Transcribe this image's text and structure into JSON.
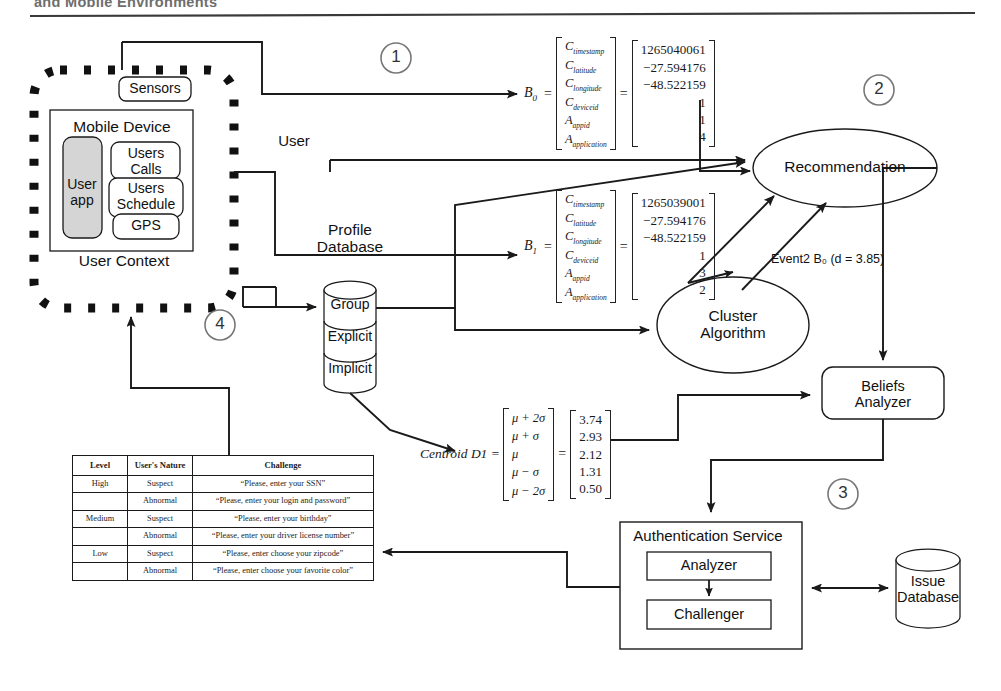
{
  "header": {
    "running_title": "and Mobile Environments"
  },
  "steps": [
    {
      "id": "step-1",
      "label": "1"
    },
    {
      "id": "step-2",
      "label": "2"
    },
    {
      "id": "step-3",
      "label": "3"
    },
    {
      "id": "step-4",
      "label": "4"
    }
  ],
  "user_context": {
    "boundary_label": "User Context",
    "sensors_label": "Sensors",
    "mobile_device": {
      "title": "Mobile Device",
      "user_app": "User\napp",
      "modules": [
        {
          "label": "Users\nCalls"
        },
        {
          "label": "Users\nSchedule"
        },
        {
          "label": "GPS"
        }
      ]
    }
  },
  "labels": {
    "user": "User",
    "event2": "Event2 B₀ (d = 3.85)"
  },
  "profile_database": {
    "title": "Profile\nDatabase",
    "segments": [
      "Group",
      "Explicit",
      "Implicit"
    ]
  },
  "nodes": {
    "recommendation": "Recommendation",
    "cluster_algorithm": "Cluster\nAlgorithm",
    "beliefs_analyzer": "Beliefs\nAnalyzer",
    "authentication_service": {
      "title": "Authentication Service",
      "analyzer": "Analyzer",
      "challenger": "Challenger"
    },
    "issue_database": "Issue\nDatabase"
  },
  "equations": {
    "b0": {
      "name": "B",
      "subscript": "0",
      "symbols": [
        "C_timestamp",
        "C_latitude",
        "C_longitude",
        "C_deviceid",
        "A_appid",
        "A_application"
      ],
      "symbol_parts": [
        {
          "base": "C",
          "sub": "timestamp"
        },
        {
          "base": "C",
          "sub": "latitude"
        },
        {
          "base": "C",
          "sub": "longitude"
        },
        {
          "base": "C",
          "sub": "deviceid"
        },
        {
          "base": "A",
          "sub": "appid"
        },
        {
          "base": "A",
          "sub": "application"
        }
      ],
      "values": [
        "1265040061",
        "−27.594176",
        "−48.522159",
        "1",
        "1",
        "4"
      ]
    },
    "b1": {
      "name": "B",
      "subscript": "1",
      "symbol_parts": [
        {
          "base": "C",
          "sub": "timestamp"
        },
        {
          "base": "C",
          "sub": "latitude"
        },
        {
          "base": "C",
          "sub": "longitude"
        },
        {
          "base": "C",
          "sub": "deviceid"
        },
        {
          "base": "A",
          "sub": "appid"
        },
        {
          "base": "A",
          "sub": "application"
        }
      ],
      "values": [
        "1265039001",
        "−27.594176",
        "−48.522159",
        "1",
        "3",
        "2"
      ]
    },
    "centroid": {
      "label": "Centroid D1 =",
      "symbols": [
        "μ + 2σ",
        "μ + σ",
        "μ",
        "μ − σ",
        "μ − 2σ"
      ],
      "values": [
        "3.74",
        "2.93",
        "2.12",
        "1.31",
        "0.50"
      ]
    }
  },
  "challenge_table": {
    "headers": [
      "Level",
      "User's\nNature",
      "Challenge"
    ],
    "rows": [
      {
        "level": "High",
        "nature": "Suspect",
        "challenge": "“Please, enter your SSN”"
      },
      {
        "level": "",
        "nature": "Abnormal",
        "challenge": "“Please, enter your login and\npassword”"
      },
      {
        "level": "Medium",
        "nature": "Suspect",
        "challenge": "“Please, enter your birthday”"
      },
      {
        "level": "",
        "nature": "Abnormal",
        "challenge": "“Please, enter your driver license\nnumber”"
      },
      {
        "level": "Low",
        "nature": "Suspect",
        "challenge": "“Please, enter choose your zipcode”"
      },
      {
        "level": "",
        "nature": "Abnormal",
        "challenge": "“Please, enter choose your favorite\ncolor”"
      }
    ]
  },
  "colors": {
    "ink": "#1a1a1a",
    "header_gray": "#6e6e6e",
    "userapp_fill": "#d5d5d5",
    "step_circle": "#555555"
  }
}
